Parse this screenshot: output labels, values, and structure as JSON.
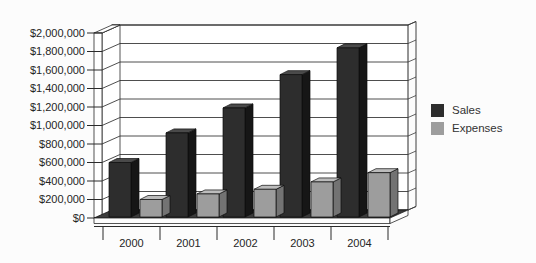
{
  "chart_data": {
    "type": "bar",
    "projection": "3d",
    "title": "",
    "categories": [
      "2000",
      "2001",
      "2002",
      "2003",
      "2004"
    ],
    "series": [
      {
        "name": "Sales",
        "color": "#2d2d2d",
        "color_top": "#4a4a4a",
        "color_side": "#161616",
        "values": [
          600000,
          920000,
          1190000,
          1550000,
          1840000
        ]
      },
      {
        "name": "Expenses",
        "color": "#9d9d9d",
        "color_top": "#bcbcbc",
        "color_side": "#737373",
        "values": [
          200000,
          260000,
          310000,
          390000,
          490000
        ]
      }
    ],
    "y_axis": {
      "min": 0,
      "max": 2000000,
      "tick_step": 200000,
      "tick_labels_top_to_bottom": [
        "$2,000,000",
        "$1,800,000",
        "$1,600,000",
        "$1,400,000",
        "$1,200,000",
        "$1,000,000",
        "$800,000",
        "$600,000",
        "$400,000",
        "$200,000",
        "$0"
      ]
    },
    "x_axis": {
      "label": ""
    },
    "grid": true,
    "legend_position": "right",
    "wall_color": "#ffffff",
    "floor_color": "#3b3b3b",
    "gridline_color": "#3a3a3a",
    "outline_color": "#2a2a2a",
    "text_color": "#252525"
  }
}
